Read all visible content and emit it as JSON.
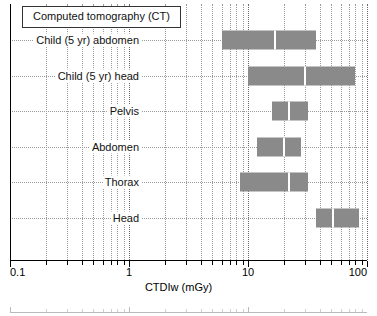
{
  "figure": {
    "title": "Computed tomography (CT)",
    "background": "#ffffff",
    "bar_color": "#8a8a8a",
    "median_color": "#ffffff"
  },
  "chart_data": {
    "type": "bar",
    "orientation": "horizontal",
    "title": "Computed tomography (CT)",
    "xlabel": "CTDIw (mGy)",
    "ylabel": "",
    "xscale": "log",
    "xlim": [
      0.1,
      100
    ],
    "grid": true,
    "legend": "none",
    "xticks": [
      0.1,
      1,
      10,
      100
    ],
    "xticklabels": [
      "0.1",
      "1",
      "10",
      "100"
    ],
    "categories": [
      "Child (5 yr) abdomen",
      "Child (5 yr) head",
      "Pelvis",
      "Abdomen",
      "Thorax",
      "Head"
    ],
    "series": [
      {
        "name": "CTDIw range (min-max with median)",
        "ranges": [
          {
            "category": "Child (5 yr) abdomen",
            "low": 6.0,
            "median": 17.0,
            "high": 37.0
          },
          {
            "category": "Child (5 yr) head",
            "low": 10.0,
            "median": 30.0,
            "high": 80.0
          },
          {
            "category": "Pelvis",
            "low": 16.0,
            "median": 22.0,
            "high": 32.0
          },
          {
            "category": "Abdomen",
            "low": 12.0,
            "median": 20.0,
            "high": 28.0
          },
          {
            "category": "Thorax",
            "low": 8.5,
            "median": 22.0,
            "high": 32.0
          },
          {
            "category": "Head",
            "low": 37.0,
            "median": 52.0,
            "high": 85.0
          }
        ]
      }
    ]
  }
}
